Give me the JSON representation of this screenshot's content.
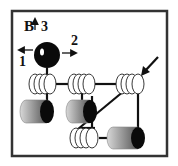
{
  "diagram": {
    "type": "mechanical-linkage",
    "labels": {
      "ball": "B",
      "dir1": "1",
      "dir2": "2",
      "dir3": "3"
    },
    "colors": {
      "frame": "#333333",
      "ink": "#111111",
      "cylinder_dark": "#0a0a0a",
      "cylinder_mid": "#7a7a7a",
      "background": "#ffffff"
    },
    "components": [
      {
        "id": "ball",
        "kind": "sphere",
        "label": "B"
      },
      {
        "id": "roller-group-1",
        "kind": "disc-stack"
      },
      {
        "id": "roller-group-2",
        "kind": "disc-stack"
      },
      {
        "id": "roller-group-3",
        "kind": "disc-stack"
      },
      {
        "id": "roller-group-4",
        "kind": "disc-stack"
      },
      {
        "id": "cylinder-1",
        "kind": "cylinder"
      },
      {
        "id": "cylinder-2",
        "kind": "cylinder"
      },
      {
        "id": "cylinder-3",
        "kind": "cylinder"
      },
      {
        "id": "input-arrow",
        "kind": "arrow"
      }
    ]
  }
}
